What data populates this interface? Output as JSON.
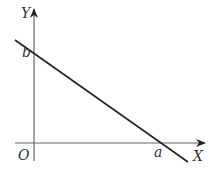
{
  "diagram": {
    "type": "coordinate-plane-line",
    "axes": {
      "x_label": "X",
      "y_label": "Y",
      "origin_label": "O"
    },
    "line": {
      "x_intercept_label": "a",
      "y_intercept_label": "b",
      "slope": "negative"
    },
    "colors": {
      "axes": "#555555",
      "line": "#222222",
      "text": "#333333"
    }
  }
}
